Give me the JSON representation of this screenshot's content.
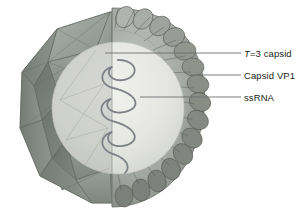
{
  "figure": {
    "background_color": "#ffffff"
  },
  "callouts": [
    {
      "id": "t3-capsid",
      "italic_prefix": "T",
      "text": "=3 capsid",
      "full_text": "T=3 capsid",
      "leader": {
        "x1": 105,
        "y1": 53,
        "x2": 241,
        "y2": 53
      }
    },
    {
      "id": "capsid-vp1",
      "italic_prefix": "",
      "text": "Capsid VP1",
      "full_text": "Capsid VP1",
      "leader": {
        "x1": 191,
        "y1": 75,
        "x2": 241,
        "y2": 75
      }
    },
    {
      "id": "ssrna",
      "italic_prefix": "",
      "text": "ssRNA",
      "full_text": "ssRNA",
      "leader": {
        "x1": 140,
        "y1": 97,
        "x2": 241,
        "y2": 97
      }
    }
  ],
  "structures": {
    "polyhedron": {
      "name": "T=3 icosahedral capsid shell",
      "face_color": "#8e9690",
      "edge_color": "#5d645f",
      "highlight_color": "#b3b9b3"
    },
    "lobed_shell": {
      "name": "Capsid VP1 protein subunit lobes",
      "lobe_count": 19,
      "face_color": "#a2a6a2",
      "shadow_color": "#70746f",
      "edge_color": "#55594f"
    },
    "core": {
      "name": "Virion interior lumen",
      "fill_color": "#e3e4e0",
      "edge_color": "#c2c4bf"
    },
    "rna": {
      "name": "ssRNA genome strand",
      "loop_count": 4,
      "stroke_color": "#8a8d91",
      "bead_color": "#6f737a"
    }
  },
  "colors": {
    "label_text": "#231f20",
    "leader_line": "#6d6e71",
    "background": "#ffffff"
  }
}
